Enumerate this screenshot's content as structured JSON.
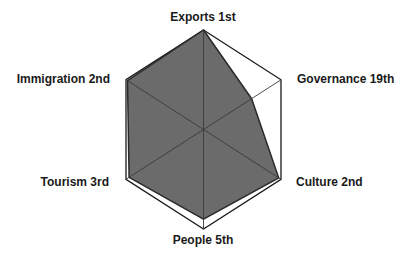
{
  "chart_data": {
    "type": "radar",
    "title": "",
    "categories": [
      "Exports 1st",
      "Governance 19th",
      "Culture 2nd",
      "People 5th",
      "Tourism 3rd",
      "Immigration 2nd"
    ],
    "axes": [
      {
        "name": "Exports",
        "rank": "1st",
        "label": "Exports 1st"
      },
      {
        "name": "Governance",
        "rank": "19th",
        "label": "Governance 19th"
      },
      {
        "name": "Culture",
        "rank": "2nd",
        "label": "Culture 2nd"
      },
      {
        "name": "People",
        "rank": "5th",
        "label": "People 5th"
      },
      {
        "name": "Tourism",
        "rank": "3rd",
        "label": "Tourism 3rd"
      },
      {
        "name": "Immigration",
        "rank": "2nd",
        "label": "Immigration 2nd"
      }
    ],
    "series": [
      {
        "name": "Rank score",
        "values": [
          1.0,
          0.62,
          0.97,
          0.9,
          0.96,
          0.98
        ]
      }
    ],
    "range": [
      0,
      1
    ],
    "grid": true,
    "legend": false,
    "colors": {
      "fill": "#6b6b6b",
      "stroke": "#2a2a2a",
      "frame": "#1a1a1a",
      "spokes": "#3a3a3a"
    }
  }
}
